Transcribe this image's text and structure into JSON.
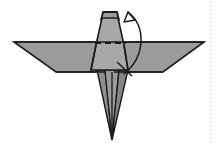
{
  "figure": {
    "title": "Origami fold step diagram",
    "background_color": "#ffffff",
    "canvas": {
      "width": 219,
      "height": 145
    }
  },
  "palette": {
    "wing_fill": "#9b9b9b",
    "body_fill": "#a8a8a8",
    "body_fill_light": "#b0b0b0",
    "tail_fill": "#8e8e8e",
    "tail_fill_dark": "#868686",
    "head_fill": "#9b9b9b",
    "outline": "#1a1a1a",
    "crease_dashed": "#1a1a1a",
    "arrow": "#1a1a1a",
    "divider_dotted": "#d4d4d4"
  },
  "shapes": {
    "left_wing": {
      "name": "left-wing",
      "points": "14,42 96,42 105,72 56,72",
      "fill": "#9b9b9b"
    },
    "right_wing": {
      "name": "right-wing",
      "points": "204,42 123,42 114,72 163,72",
      "fill": "#9b9b9b"
    },
    "body": {
      "name": "body-panel",
      "points": "102,18 118,18 124,45 128,70 91,70 96,45",
      "fill": "#a8a8a8"
    },
    "head": {
      "name": "head-tip",
      "points": "103,12 117,12 119,20 101,20",
      "fill": "#9b9b9b"
    },
    "tail_left": {
      "name": "tail-left-flap",
      "points": "97,70 112,140 105,70",
      "fill": "#8e8e8e"
    },
    "tail_right": {
      "name": "tail-right-flap",
      "points": "112,140 128,70 119,70",
      "fill": "#868686"
    },
    "tail_center": {
      "name": "tail-center-panel",
      "points": "105,70 119,70 112,140",
      "fill": "#9b9b9b"
    }
  },
  "creases": {
    "valley_dashed": {
      "name": "horizontal-valley-crease",
      "label": "dashed fold line",
      "x1": 95,
      "y1": 43,
      "x2": 126,
      "y2": 43,
      "dash": "6 4"
    },
    "body_left_edge": {
      "x1": 96,
      "y1": 45,
      "x2": 91,
      "y2": 70
    },
    "body_right_edge": {
      "x1": 124,
      "y1": 45,
      "x2": 128,
      "y2": 70
    },
    "tail_spine": {
      "x1": 112,
      "y1": 72,
      "x2": 112,
      "y2": 140
    },
    "wing_seam_left": {
      "x1": 56,
      "y1": 72,
      "x2": 105,
      "y2": 72
    },
    "wing_seam_right": {
      "x1": 114,
      "y1": 72,
      "x2": 163,
      "y2": 72
    }
  },
  "annotations": {
    "fold_arrow": {
      "name": "fold-direction-arrow",
      "label": "rotate / fold upward",
      "path": "M 124,74 C 146,56 146,26 128,12",
      "head_points": "128,12 124,22 135,20",
      "direction": "up"
    },
    "arrow_tail_crossing": {
      "name": "arrow-tail-crossing-line",
      "x1": 117,
      "y1": 62,
      "x2": 132,
      "y2": 76
    }
  },
  "divider": {
    "name": "page-divider",
    "label": "dotted vertical rule",
    "x": 211,
    "y1": 2,
    "y2": 143,
    "dash": "1 3",
    "color": "#d4d4d4"
  }
}
